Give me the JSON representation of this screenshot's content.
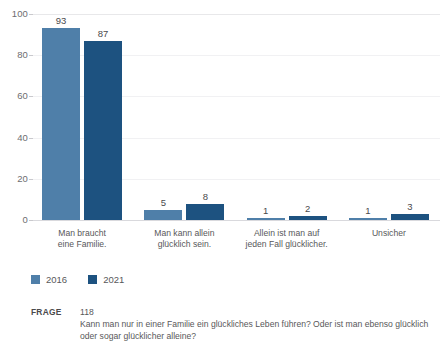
{
  "chart_data": {
    "type": "bar",
    "title": "",
    "subtitle": "",
    "xlabel": "",
    "ylabel": "",
    "ylim": [
      0,
      100
    ],
    "yticks": [
      0,
      20,
      40,
      60,
      80,
      100
    ],
    "ytick_labels": [
      "0",
      "20",
      "40",
      "60",
      "80",
      "100"
    ],
    "grid": true,
    "legend_position": "bottom-left",
    "categories": [
      "Man braucht\neine Familie.",
      "Man kann allein\nglücklich sein.",
      "Allein ist man auf\njeden Fall glücklicher.",
      "Unsicher"
    ],
    "category_lines": [
      [
        "Man braucht",
        "eine Familie."
      ],
      [
        "Man kann allein",
        "glücklich sein."
      ],
      [
        "Allein ist man auf",
        "jeden Fall glücklicher."
      ],
      [
        "Unsicher",
        ""
      ]
    ],
    "series": [
      {
        "name": "2016",
        "color": "#4f7fa9",
        "values": [
          93,
          5,
          1,
          1
        ]
      },
      {
        "name": "2021",
        "color": "#1d5280",
        "values": [
          87,
          8,
          2,
          3
        ]
      }
    ]
  },
  "legend": {
    "items": [
      {
        "label": "2016",
        "color": "#4f7fa9"
      },
      {
        "label": "2021",
        "color": "#1d5280"
      }
    ]
  },
  "footer": {
    "tag": "FRAGE",
    "number": "118",
    "question": "Kann man nur in einer Familie ein glückliches Leben führen? Oder ist man ebenso glücklich oder sogar glücklicher alleine?"
  },
  "colors": {
    "series_2016": "#4f7fa9",
    "series_2021": "#1d5280",
    "gridline": "#f1f1f3",
    "axis": "#d9d9dd",
    "text": "#58585a"
  }
}
